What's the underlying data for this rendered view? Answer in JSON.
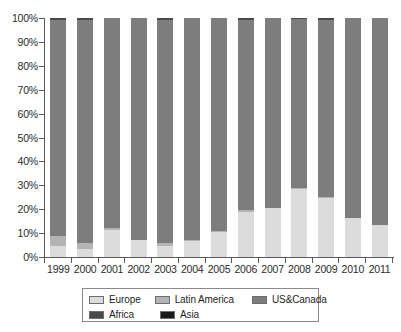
{
  "chart_data": {
    "type": "bar",
    "stacked": true,
    "stack_total": 100,
    "title": "",
    "subtitle": "",
    "xlabel": "",
    "ylabel": "",
    "ylim": [
      0,
      100
    ],
    "y_unit": "%",
    "grid": false,
    "legend_position": "bottom",
    "categories": [
      "1999",
      "2000",
      "2001",
      "2002",
      "2003",
      "2004",
      "2005",
      "2006",
      "2007",
      "2008",
      "2009",
      "2010",
      "2011"
    ],
    "ytick_labels": [
      "0%",
      "10%",
      "20%",
      "30%",
      "40%",
      "50%",
      "60%",
      "70%",
      "80%",
      "90%",
      "100%"
    ],
    "ytick_values": [
      0,
      10,
      20,
      30,
      40,
      50,
      60,
      70,
      80,
      90,
      100
    ],
    "series": [
      {
        "name": "Europe",
        "color": "#dcdcdc",
        "values": [
          4.5,
          3.5,
          11.5,
          7,
          4.5,
          6.5,
          10.5,
          19,
          20.5,
          28.5,
          24.5,
          16.5,
          13.5
        ]
      },
      {
        "name": "Latin America",
        "color": "#b4b4b4",
        "values": [
          4.5,
          2.5,
          0.5,
          0,
          1.5,
          0.5,
          0.5,
          0.5,
          0,
          0.5,
          0.5,
          0,
          0
        ]
      },
      {
        "name": "US&Canada",
        "color": "#7d7d7d",
        "values": [
          90,
          93,
          88,
          93,
          93,
          93,
          89,
          79.5,
          79.5,
          70.5,
          74,
          83.5,
          86.5
        ]
      },
      {
        "name": "Africa",
        "color": "#4a4a4a",
        "values": [
          1,
          1,
          0,
          0,
          1,
          0,
          0,
          1,
          0,
          0.5,
          1,
          0,
          0
        ]
      },
      {
        "name": "Asia",
        "color": "#1a1a1a",
        "values": [
          0,
          0,
          0,
          0,
          0,
          0,
          0,
          0,
          0,
          0,
          0,
          0,
          0
        ]
      }
    ]
  },
  "legend": {
    "rows": [
      [
        {
          "label": "Europe",
          "color": "#dcdcdc"
        },
        {
          "label": "Latin America",
          "color": "#b4b4b4"
        },
        {
          "label": "US&Canada",
          "color": "#7d7d7d"
        }
      ],
      [
        {
          "label": "Africa",
          "color": "#4a4a4a"
        },
        {
          "label": "Asia",
          "color": "#1a1a1a"
        }
      ]
    ]
  }
}
